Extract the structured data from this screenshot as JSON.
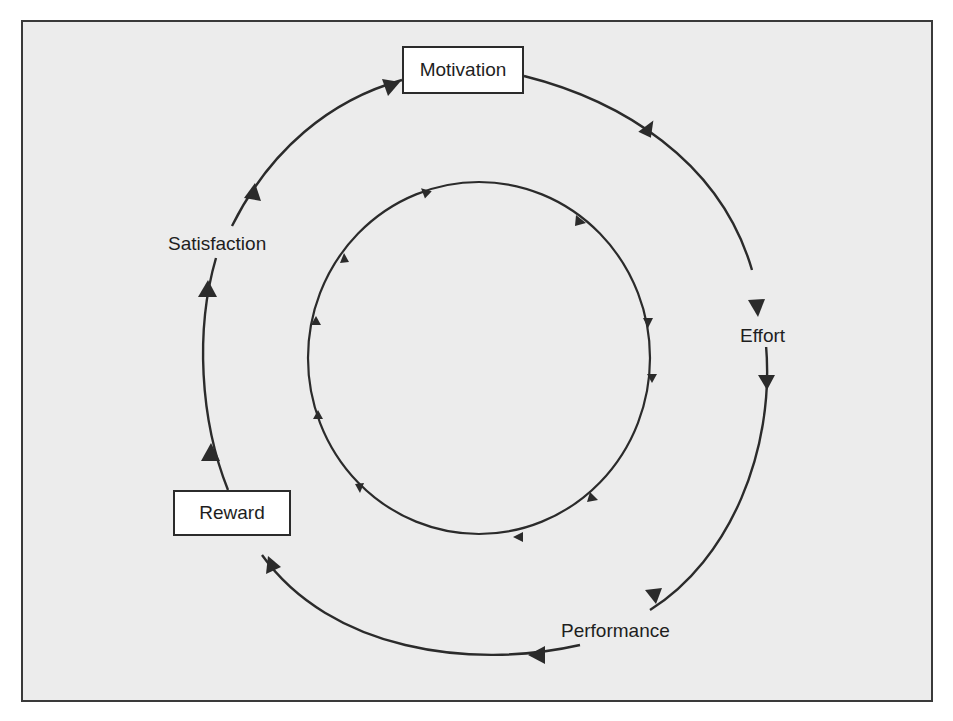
{
  "diagram": {
    "type": "cycle",
    "nodes": {
      "motivation": "Motivation",
      "effort": "Effort",
      "performance": "Performance",
      "reward": "Reward",
      "satisfaction": "Satisfaction"
    },
    "outer_cycle_order": [
      "Motivation",
      "Effort",
      "Performance",
      "Reward",
      "Satisfaction"
    ],
    "boxed_nodes": [
      "Motivation",
      "Reward"
    ],
    "inner_cycle": "clockwise circle with arrowheads",
    "colors": {
      "background": "#ececec",
      "line": "#2b2b2b",
      "box_fill": "#ffffff",
      "frame": "#3a3a3a"
    }
  }
}
